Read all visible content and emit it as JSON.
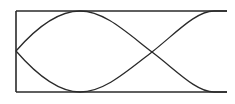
{
  "diagram": {
    "type": "standing-wave-mode-shape",
    "colors": {
      "background": "#ffffff",
      "stroke": "#2a2a2a"
    },
    "box": {
      "left": 16,
      "right": 227,
      "top": 11,
      "bottom": 92,
      "left_closed": true,
      "right_closed": false
    },
    "curves": [
      {
        "name": "upper-curve",
        "start": [
          16,
          51
        ],
        "peak": [
          80,
          11
        ],
        "crossing": [
          152,
          52
        ],
        "end": [
          214,
          92
        ]
      },
      {
        "name": "lower-curve",
        "start": [
          16,
          51
        ],
        "trough": [
          80,
          92
        ],
        "crossing": [
          152,
          52
        ],
        "end": [
          214,
          11
        ]
      }
    ],
    "labels": []
  }
}
